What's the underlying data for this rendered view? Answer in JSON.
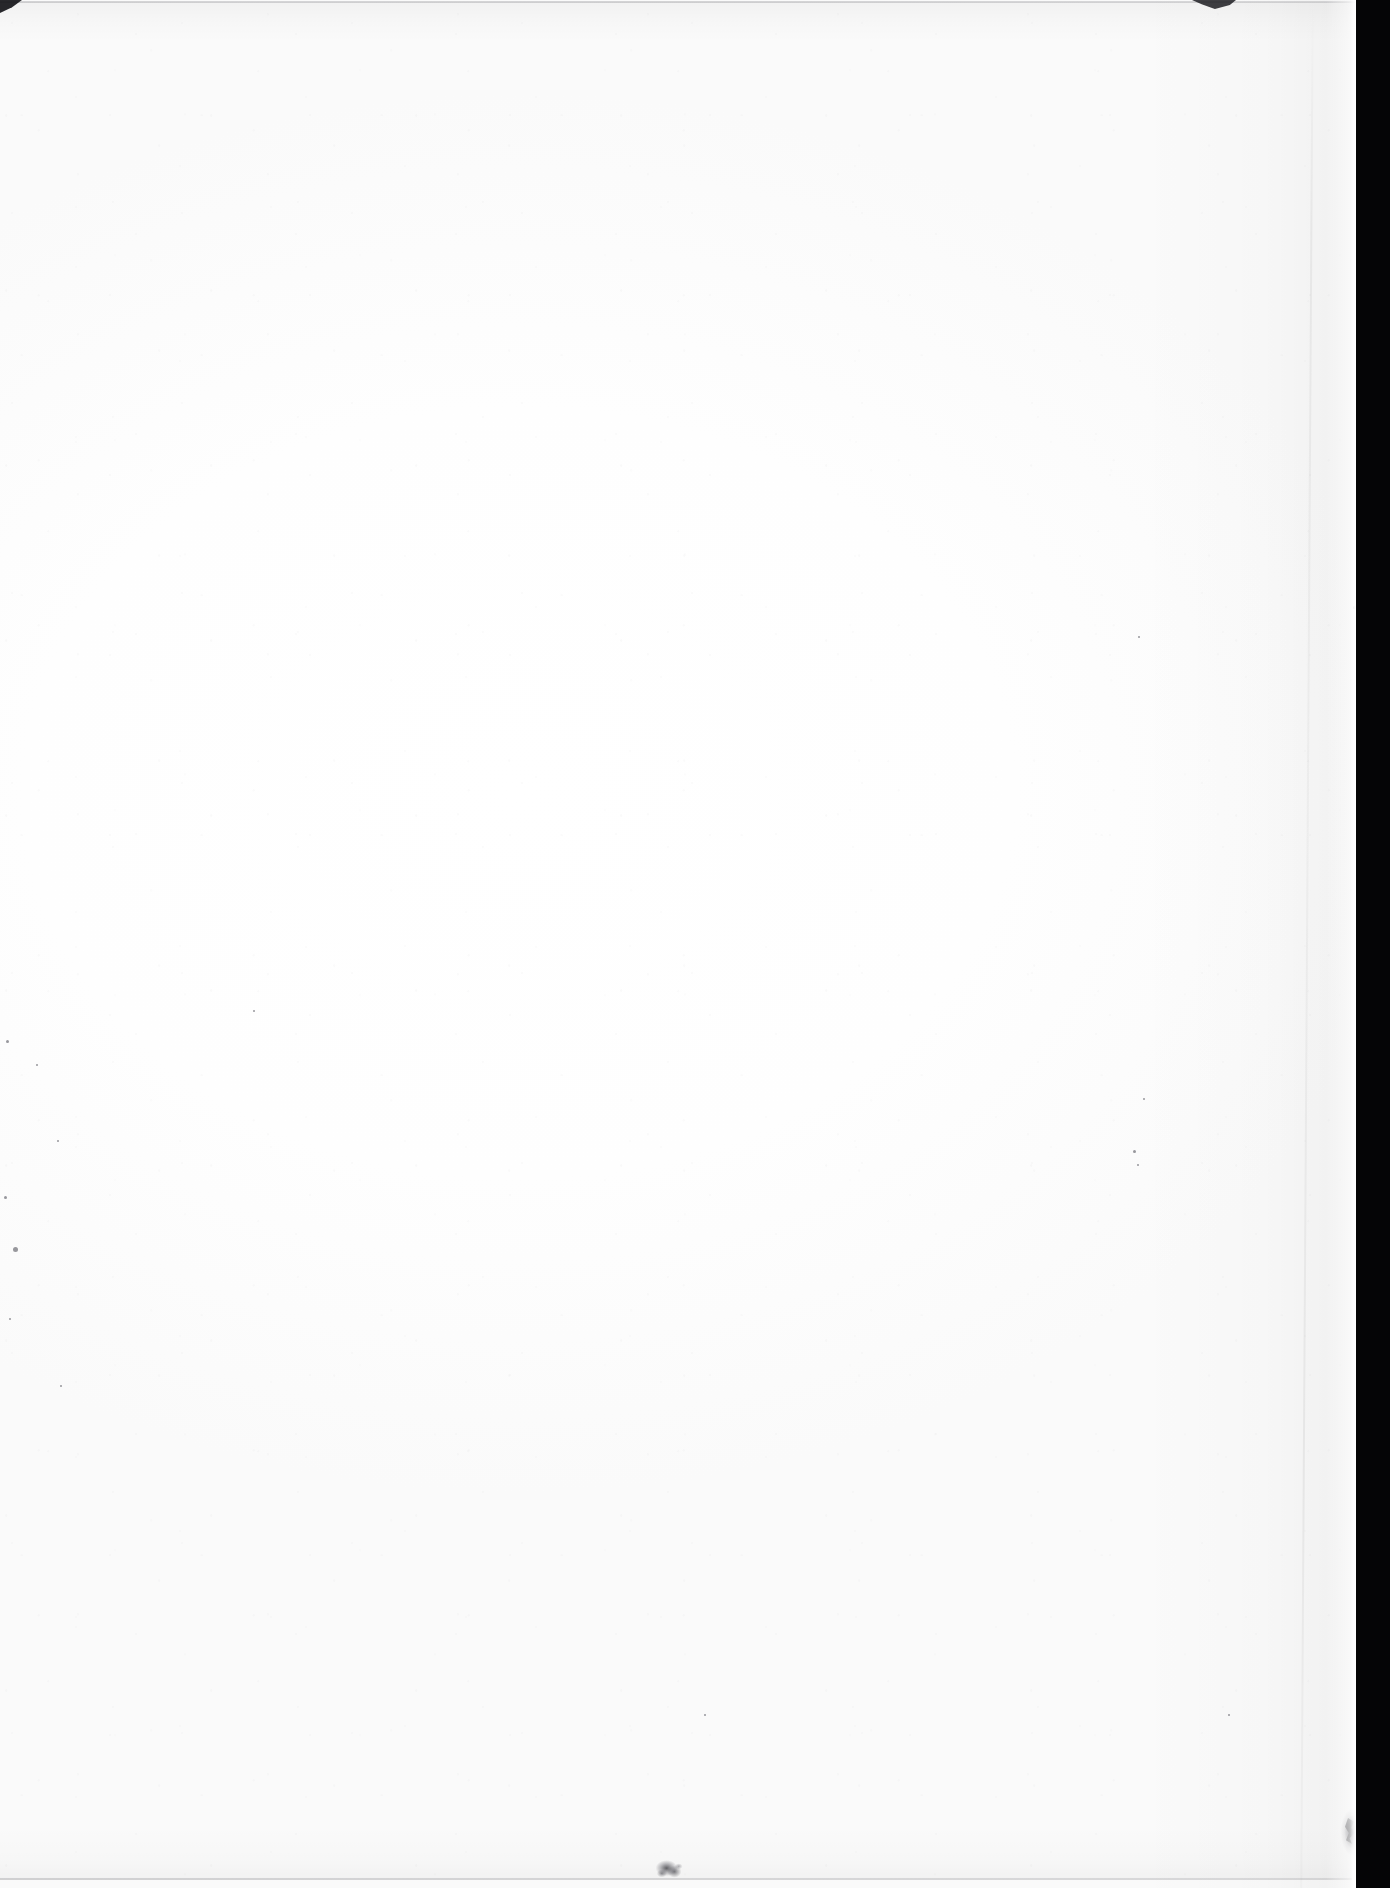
{
  "document": {
    "type": "scanned-page",
    "content_text": "",
    "is_blank": true,
    "description": "Blank scanned leaf of a bound document"
  },
  "canvas": {
    "width_px": 1390,
    "height_px": 1888,
    "background_color": "#ffffff"
  },
  "page": {
    "paper_color": "#ffffff",
    "paper_left_px": 0,
    "paper_top_px": 0,
    "paper_width_px": 1364,
    "paper_height_px": 1888,
    "body_text": "",
    "visible_characters": 0
  },
  "gutter": {
    "label": "scanner-gutter",
    "color": "#050506",
    "side": "right",
    "width_px": 34,
    "start_x_px": 1356
  },
  "edges": {
    "top_line_color": "#78787d",
    "bottom_line_color": "#73737a",
    "right_edge_x_px": 1360
  },
  "defects": [
    {
      "name": "corner-nick-top-left",
      "x": 0,
      "y": 0,
      "w": 22,
      "h": 13,
      "color": "#16161a"
    },
    {
      "name": "edge-notch-top",
      "x": 1192,
      "y": 0,
      "w": 44,
      "h": 9,
      "color": "#232328"
    },
    {
      "name": "ink-blot-bottom",
      "x": 654,
      "y": 1858,
      "w": 30,
      "h": 22,
      "color": "#28282e"
    },
    {
      "name": "edge-tear-right",
      "x": 1338,
      "y": 1808,
      "w": 26,
      "h": 48,
      "color": "#1e1e22"
    }
  ],
  "specks": [
    {
      "x": 13,
      "y": 1247,
      "d": 5
    },
    {
      "x": 6,
      "y": 1040,
      "d": 3
    },
    {
      "x": 4,
      "y": 1196,
      "d": 3
    },
    {
      "x": 9,
      "y": 1318,
      "d": 2
    },
    {
      "x": 57,
      "y": 1140,
      "d": 2
    },
    {
      "x": 36,
      "y": 1064,
      "d": 2
    },
    {
      "x": 60,
      "y": 1385,
      "d": 2
    },
    {
      "x": 1133,
      "y": 1150,
      "d": 3
    },
    {
      "x": 1137,
      "y": 1164,
      "d": 2
    },
    {
      "x": 1353,
      "y": 606,
      "d": 3
    },
    {
      "x": 1358,
      "y": 1632,
      "d": 3
    },
    {
      "x": 1138,
      "y": 636,
      "d": 2
    },
    {
      "x": 1143,
      "y": 1098,
      "d": 2
    },
    {
      "x": 704,
      "y": 1714,
      "d": 2
    },
    {
      "x": 1228,
      "y": 1714,
      "d": 2
    },
    {
      "x": 253,
      "y": 1010,
      "d": 2
    }
  ]
}
